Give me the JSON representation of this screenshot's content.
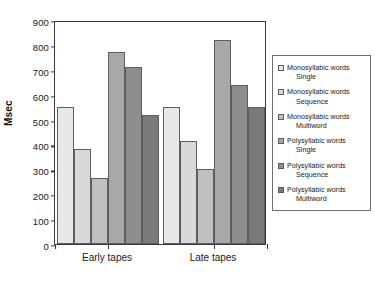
{
  "chart_data": {
    "type": "bar",
    "title": "",
    "xlabel": "",
    "ylabel": "Msec",
    "categories": [
      "Early tapes",
      "Late tapes"
    ],
    "ylim": [
      0,
      900
    ],
    "ytick_step": 100,
    "yticks": [
      900,
      800,
      700,
      600,
      500,
      400,
      300,
      200,
      100,
      0
    ],
    "grid": false,
    "legend_position": "right",
    "series": [
      {
        "name": "Monosyllabic words Single",
        "word_type": "Monosyllabic words",
        "condition": "Single",
        "color": "#e8e8e8",
        "values": [
          550,
          550
        ]
      },
      {
        "name": "Monosyllabic words Sequence",
        "word_type": "Monosyllabic words",
        "condition": "Sequence",
        "color": "#d9d9d9",
        "values": [
          380,
          415
        ]
      },
      {
        "name": "Monosyllabic words Multiword",
        "word_type": "Monosyllabic words",
        "condition": "Multiword",
        "color": "#c0c0c0",
        "values": [
          265,
          300
        ]
      },
      {
        "name": "Polysyllabic words Single",
        "word_type": "Polysyllabic words",
        "condition": "Single",
        "color": "#a8a8a8",
        "values": [
          770,
          820
        ]
      },
      {
        "name": "Polysyllabic words Sequence",
        "word_type": "Polysyllabic words",
        "condition": "Sequence",
        "color": "#8e8e8e",
        "values": [
          712,
          640
        ]
      },
      {
        "name": "Polysyllabic words Multiword",
        "word_type": "Polysyllabic words",
        "condition": "Multiword",
        "color": "#7a7a7a",
        "values": [
          518,
          550
        ]
      }
    ]
  },
  "legend": {
    "items": [
      {
        "line1": "Monosyllabic words",
        "line2": "Single",
        "color": "#e8e8e8"
      },
      {
        "line1": "Monosyllabic words",
        "line2": "Sequence",
        "color": "#d9d9d9"
      },
      {
        "line1": "Monosyllabic words",
        "line2": "Multiword",
        "color": "#c0c0c0"
      },
      {
        "line1": "Polysyllabic words",
        "line2": "Single",
        "color": "#a8a8a8"
      },
      {
        "line1": "Polysyllabic words",
        "line2": "Sequence",
        "color": "#8e8e8e"
      },
      {
        "line1": "Polysyllabic words",
        "line2": "Multiword",
        "color": "#7a7a7a"
      }
    ]
  }
}
